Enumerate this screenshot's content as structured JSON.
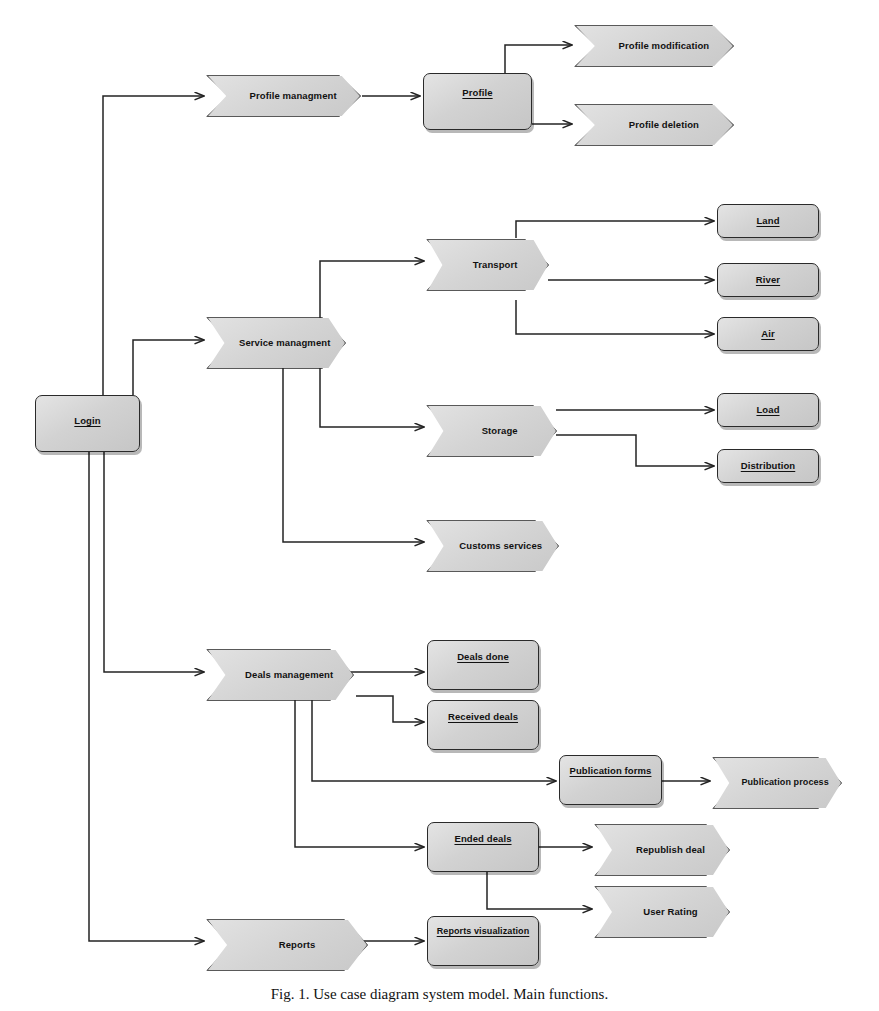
{
  "figure": {
    "caption": "Fig. 1. Use case diagram  system model. Main functions.",
    "background": "#ffffff",
    "line_color": "#232323",
    "node_fill": "#d6d6d6",
    "node_stroke": "#2a2a2a"
  },
  "nodes": {
    "login": {
      "label": "Login",
      "shape": "rect",
      "underline": true
    },
    "profile_management": {
      "label": "Profile managment",
      "shape": "chevron",
      "underline": false
    },
    "profile": {
      "label": "Profile",
      "shape": "rect",
      "underline": true
    },
    "profile_modification": {
      "label": "Profile modification",
      "shape": "chevron",
      "underline": false
    },
    "profile_deletion": {
      "label": "Profile deletion",
      "shape": "chevron",
      "underline": false
    },
    "service_management": {
      "label": "Service managment",
      "shape": "chevron",
      "underline": false
    },
    "transport": {
      "label": "Transport",
      "shape": "chevron",
      "underline": false
    },
    "land": {
      "label": "Land",
      "shape": "rect",
      "underline": true
    },
    "river": {
      "label": "River",
      "shape": "rect",
      "underline": true
    },
    "air": {
      "label": "Air",
      "shape": "rect",
      "underline": true
    },
    "storage": {
      "label": "Storage",
      "shape": "chevron",
      "underline": false
    },
    "load": {
      "label": "Load",
      "shape": "rect",
      "underline": true
    },
    "distribution": {
      "label": "Distribution",
      "shape": "rect",
      "underline": true
    },
    "customs_services": {
      "label": "Customs services",
      "shape": "chevron",
      "underline": false
    },
    "deals_management": {
      "label": "Deals management",
      "shape": "chevron",
      "underline": false
    },
    "deals_done": {
      "label": "Deals done",
      "shape": "rect",
      "underline": true
    },
    "received_deals": {
      "label": "Received deals",
      "shape": "rect",
      "underline": true
    },
    "publication_forms": {
      "label": "Publication forms",
      "shape": "rect",
      "underline": true
    },
    "publication_process": {
      "label": "Publication process",
      "shape": "chevron",
      "underline": false
    },
    "ended_deals": {
      "label": "Ended deals",
      "shape": "rect",
      "underline": true
    },
    "republish_deal": {
      "label": "Republish deal",
      "shape": "chevron",
      "underline": false
    },
    "user_rating": {
      "label": "User Rating",
      "shape": "chevron",
      "underline": false
    },
    "reports": {
      "label": "Reports",
      "shape": "chevron",
      "underline": false
    },
    "reports_visualization": {
      "label": "Reports visualization",
      "shape": "rect",
      "underline": true
    }
  },
  "edges": [
    {
      "from": "login",
      "to": "profile_management"
    },
    {
      "from": "login",
      "to": "service_management"
    },
    {
      "from": "login",
      "to": "deals_management"
    },
    {
      "from": "login",
      "to": "reports"
    },
    {
      "from": "profile_management",
      "to": "profile"
    },
    {
      "from": "profile",
      "to": "profile_modification"
    },
    {
      "from": "profile",
      "to": "profile_deletion"
    },
    {
      "from": "service_management",
      "to": "transport"
    },
    {
      "from": "service_management",
      "to": "storage"
    },
    {
      "from": "service_management",
      "to": "customs_services"
    },
    {
      "from": "transport",
      "to": "land"
    },
    {
      "from": "transport",
      "to": "river"
    },
    {
      "from": "transport",
      "to": "air"
    },
    {
      "from": "storage",
      "to": "load"
    },
    {
      "from": "storage",
      "to": "distribution"
    },
    {
      "from": "deals_management",
      "to": "deals_done"
    },
    {
      "from": "deals_management",
      "to": "received_deals"
    },
    {
      "from": "deals_management",
      "to": "publication_forms"
    },
    {
      "from": "deals_management",
      "to": "ended_deals"
    },
    {
      "from": "publication_forms",
      "to": "publication_process"
    },
    {
      "from": "ended_deals",
      "to": "republish_deal"
    },
    {
      "from": "ended_deals",
      "to": "user_rating"
    }
  ]
}
